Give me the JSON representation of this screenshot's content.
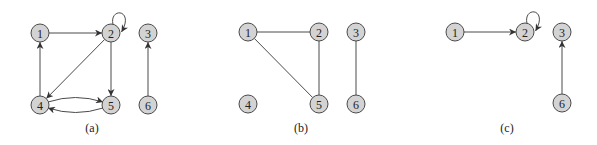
{
  "figure": {
    "style": {
      "node_fill": "#d3d3d3",
      "node_stroke": "#4a4a4a",
      "edge_color": "#4a4a4a",
      "node_radius": 9
    },
    "panels": [
      {
        "id": "a",
        "caption": "(a)",
        "caption_pos": [
          92,
          132
        ],
        "directed": true,
        "nodes": [
          {
            "id": "1",
            "label": "1",
            "x": 40,
            "y": 33
          },
          {
            "id": "2",
            "label": "2",
            "x": 111,
            "y": 33
          },
          {
            "id": "3",
            "label": "3",
            "x": 148,
            "y": 33
          },
          {
            "id": "4",
            "label": "4",
            "x": 40,
            "y": 105
          },
          {
            "id": "5",
            "label": "5",
            "x": 111,
            "y": 105
          },
          {
            "id": "6",
            "label": "6",
            "x": 148,
            "y": 105
          }
        ],
        "edges": [
          {
            "from": "1",
            "to": "2",
            "type": "straight"
          },
          {
            "from": "2",
            "to": "2",
            "type": "self-loop"
          },
          {
            "from": "2",
            "to": "4",
            "type": "straight"
          },
          {
            "from": "2",
            "to": "5",
            "type": "straight"
          },
          {
            "from": "4",
            "to": "1",
            "type": "straight"
          },
          {
            "from": "4",
            "to": "5",
            "type": "curve-up"
          },
          {
            "from": "5",
            "to": "4",
            "type": "curve-down"
          },
          {
            "from": "6",
            "to": "3",
            "type": "straight"
          }
        ]
      },
      {
        "id": "b",
        "caption": "(b)",
        "caption_pos": [
          301,
          132
        ],
        "directed": false,
        "nodes": [
          {
            "id": "1",
            "label": "1",
            "x": 248,
            "y": 32
          },
          {
            "id": "2",
            "label": "2",
            "x": 319,
            "y": 32
          },
          {
            "id": "3",
            "label": "3",
            "x": 356,
            "y": 32
          },
          {
            "id": "4",
            "label": "4",
            "x": 248,
            "y": 104
          },
          {
            "id": "5",
            "label": "5",
            "x": 319,
            "y": 104
          },
          {
            "id": "6",
            "label": "6",
            "x": 356,
            "y": 104
          }
        ],
        "edges": [
          {
            "from": "1",
            "to": "2",
            "type": "straight"
          },
          {
            "from": "1",
            "to": "5",
            "type": "straight"
          },
          {
            "from": "2",
            "to": "5",
            "type": "straight"
          },
          {
            "from": "3",
            "to": "6",
            "type": "straight"
          }
        ]
      },
      {
        "id": "c",
        "caption": "(c)",
        "caption_pos": [
          507,
          132
        ],
        "directed": true,
        "nodes": [
          {
            "id": "1",
            "label": "1",
            "x": 455,
            "y": 32
          },
          {
            "id": "2",
            "label": "2",
            "x": 525,
            "y": 32
          },
          {
            "id": "3",
            "label": "3",
            "x": 562,
            "y": 32
          },
          {
            "id": "6",
            "label": "6",
            "x": 562,
            "y": 103
          }
        ],
        "edges": [
          {
            "from": "1",
            "to": "2",
            "type": "straight"
          },
          {
            "from": "2",
            "to": "2",
            "type": "self-loop"
          },
          {
            "from": "6",
            "to": "3",
            "type": "straight"
          }
        ]
      }
    ]
  }
}
